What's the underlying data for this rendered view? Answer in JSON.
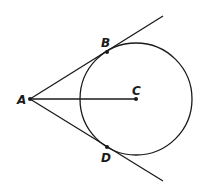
{
  "diagram": {
    "type": "geometry",
    "colors": {
      "stroke": "#1a1a1a",
      "background": "#ffffff"
    },
    "points": {
      "A": {
        "label": "A",
        "x": 30,
        "y": 99
      },
      "B": {
        "label": "B",
        "x": 107,
        "y": 52
      },
      "C": {
        "label": "C",
        "x": 136,
        "y": 99
      },
      "D": {
        "label": "D",
        "x": 107,
        "y": 147
      }
    },
    "circle": {
      "center": "C",
      "cx": 136,
      "cy": 99,
      "r": 56
    },
    "segments": [
      {
        "name": "tangent-AB",
        "from": "A",
        "through": "B",
        "x1": 30,
        "y1": 99,
        "x2": 163,
        "y2": 16
      },
      {
        "name": "tangent-AD",
        "from": "A",
        "through": "D",
        "x1": 30,
        "y1": 99,
        "x2": 163,
        "y2": 181
      },
      {
        "name": "segment-AC",
        "from": "A",
        "to": "C",
        "x1": 30,
        "y1": 99,
        "x2": 136,
        "y2": 99
      }
    ],
    "labels": [
      {
        "text": "A",
        "x": 17,
        "y": 104
      },
      {
        "text": "B",
        "x": 101,
        "y": 47
      },
      {
        "text": "C",
        "x": 132,
        "y": 95
      },
      {
        "text": "D",
        "x": 101,
        "y": 162
      }
    ]
  }
}
